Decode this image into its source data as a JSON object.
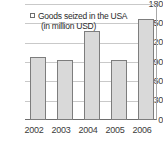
{
  "chart_data": {
    "type": "bar",
    "title": "",
    "subtitle": "",
    "xlabel": "",
    "ylabel": "",
    "categories": [
      "2002",
      "2003",
      "2004",
      "2005",
      "2006"
    ],
    "values": [
      98,
      93,
      138,
      93,
      156
    ],
    "series": [
      {
        "name": "Goods seized in the USA (in million USD)",
        "values": [
          98,
          93,
          138,
          93,
          156
        ]
      }
    ],
    "ylim": [
      0,
      180
    ],
    "yticks": [
      0,
      30,
      60,
      90,
      120,
      150,
      180
    ],
    "ytick_labels": [
      "0",
      "30",
      "60",
      "90",
      "120",
      "150",
      "180"
    ],
    "grid": true,
    "grid_axis": "y",
    "legend_position": "top-left-inside",
    "legend": {
      "marker": "square-outline-marker",
      "line1": "Goods seized in the USA",
      "line2": "(in million USD)"
    },
    "colors": {
      "bar_fill": "#d9d9d9",
      "bar_border": "#7d7d7d",
      "gridline": "#c9c9c9",
      "axis": "#6e6e6e",
      "text": "#3b3b3b",
      "background": "#ffffff"
    }
  }
}
